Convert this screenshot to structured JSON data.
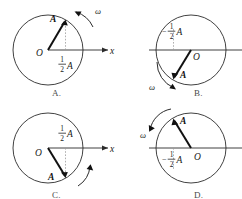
{
  "figure": {
    "kind": "multiple-choice-physics-figure",
    "background_color": "#ffffff",
    "ink_color": "#1a1a1a",
    "faint_color": "#9a9a9a",
    "top_cropped_text": "…"
  },
  "option_labels": {
    "a": "A.",
    "b": "B.",
    "c": "C.",
    "d": "D."
  },
  "symbols": {
    "origin": "O",
    "axis_x": "x",
    "vector": "A",
    "omega": "ω",
    "half_numerator": "1",
    "half_denominator": "2",
    "half_amplitude": "A",
    "negative_sign": "−"
  },
  "panels": [
    {
      "id": "a",
      "name": "panel-a",
      "origin_label": "O",
      "axis_label": "x",
      "vector_label": "A",
      "omega_label": "ω",
      "projection_label": {
        "sign": "",
        "numerator": "1",
        "denominator": "2",
        "amplitude": "A",
        "text": "½A"
      },
      "origin_side": "left",
      "vector_angle_deg": 60,
      "vector_quadrant": "upper-right",
      "omega_direction": "counterclockwise",
      "omega_position": "upper-right-outside",
      "projection_label_position": "below-axis-right-of-origin",
      "has_dashed_projection": true
    },
    {
      "id": "b",
      "name": "panel-b",
      "origin_label": "O",
      "axis_label": "x",
      "vector_label": "A",
      "omega_label": "ω",
      "projection_label": {
        "sign": "−",
        "numerator": "1",
        "denominator": "2",
        "amplitude": "A",
        "text": "−½A"
      },
      "origin_side": "right",
      "vector_angle_deg": 240,
      "vector_quadrant": "lower-left",
      "omega_direction": "counterclockwise",
      "omega_position": "lower-left-outside",
      "projection_label_position": "above-axis-left-of-origin",
      "has_dashed_projection": true
    },
    {
      "id": "c",
      "name": "panel-c",
      "origin_label": "O",
      "axis_label": "x",
      "vector_label": "A",
      "omega_label": "",
      "projection_label": {
        "sign": "",
        "numerator": "1",
        "denominator": "2",
        "amplitude": "A",
        "text": "½A"
      },
      "origin_side": "left",
      "vector_angle_deg": -60,
      "vector_quadrant": "lower-right",
      "omega_direction": "counterclockwise",
      "omega_position": "lower-right-outside",
      "projection_label_position": "above-axis-right-of-origin",
      "has_dashed_projection": true
    },
    {
      "id": "d",
      "name": "panel-d",
      "origin_label": "O",
      "axis_label": "x",
      "vector_label": "A",
      "omega_label": "ω",
      "projection_label": {
        "sign": "−",
        "numerator": "1",
        "denominator": "2",
        "amplitude": "A",
        "text": "−½A"
      },
      "origin_side": "right",
      "vector_angle_deg": 120,
      "vector_quadrant": "upper-left",
      "omega_direction": "counterclockwise",
      "omega_position": "upper-left-outside",
      "projection_label_position": "below-axis-left-of-origin",
      "has_dashed_projection": true
    }
  ]
}
